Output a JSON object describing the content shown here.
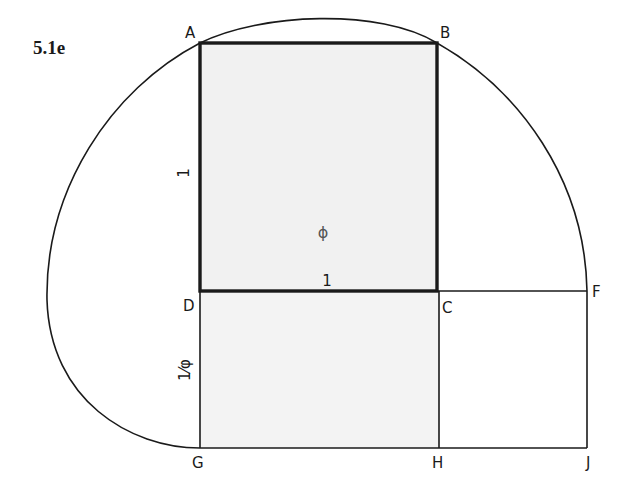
{
  "figure": {
    "label": "5.1e",
    "colors": {
      "shade": "#f1f1f1",
      "stroke": "#1a1a1a",
      "phi": "#555555"
    },
    "points": {
      "A": "A",
      "B": "B",
      "C": "C",
      "D": "D",
      "F": "F",
      "G": "G",
      "H": "H",
      "J": "J"
    },
    "dimensions": {
      "square_side_vertical": "1",
      "square_side_horizontal": "1",
      "rect_side_vertical": "1/φ",
      "rect_side_vertical_display": "1⁄φ"
    },
    "center_symbol": "ϕ"
  }
}
